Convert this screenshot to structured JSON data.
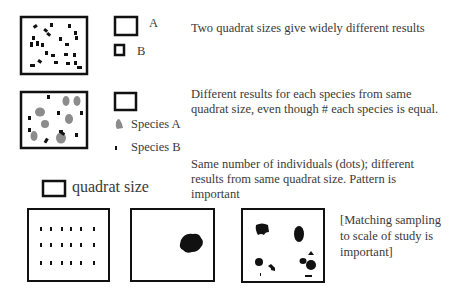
{
  "row1": {
    "legend_a": "A",
    "legend_b": "B",
    "caption": "Two quadrat sizes give widely different results"
  },
  "row2": {
    "legend_species_a": "Species A",
    "legend_species_b": "Species B",
    "caption_line1": "Different results for each species from same",
    "caption_line2": "quadrat size, even though # each species is equal."
  },
  "row3": {
    "quadrat_label": "quadrat size",
    "caption_line1": "Same number of individuals (dots); different",
    "caption_line2": "results from same quadrat size. Pattern is",
    "caption_line3": "important",
    "note_line1": "[Matching sampling",
    "note_line2": "to scale of study is",
    "note_line3": "important]"
  },
  "colors": {
    "ink": "#111111",
    "species_a": "#8c8c8c",
    "text": "#3a3a3a"
  }
}
